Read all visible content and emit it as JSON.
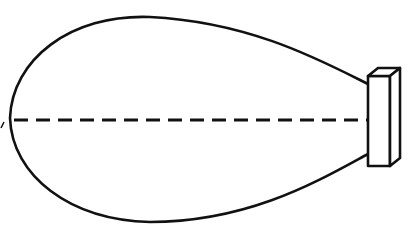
{
  "diagram": {
    "kind": "radiation-pattern",
    "colors": {
      "stroke": "#111111",
      "background": "#ffffff"
    },
    "elements": {
      "lobe": {
        "label": "radiation lobe"
      },
      "axis": {
        "label": "beam axis",
        "style": "dashed"
      },
      "source": {
        "label": "source block"
      }
    }
  }
}
